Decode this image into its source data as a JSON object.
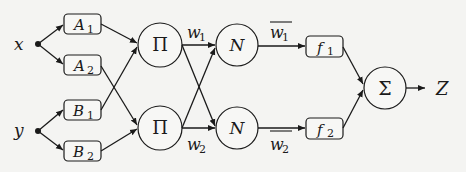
{
  "diagram": {
    "type": "ANFIS architecture",
    "inputs": [
      {
        "id": "x",
        "label": "x"
      },
      {
        "id": "y",
        "label": "y"
      }
    ],
    "layer1": [
      {
        "id": "A1",
        "label": "A",
        "sub": "1"
      },
      {
        "id": "A2",
        "label": "A",
        "sub": "2"
      },
      {
        "id": "B1",
        "label": "B",
        "sub": "1"
      },
      {
        "id": "B2",
        "label": "B",
        "sub": "2"
      }
    ],
    "layer2": [
      {
        "id": "P1",
        "symbol": "Π"
      },
      {
        "id": "P2",
        "symbol": "Π"
      }
    ],
    "weights": [
      {
        "label": "w",
        "sub": "1"
      },
      {
        "label": "w",
        "sub": "2"
      }
    ],
    "layer3": [
      {
        "id": "N1",
        "symbol": "N"
      },
      {
        "id": "N2",
        "symbol": "N"
      }
    ],
    "normalized_weights": [
      {
        "label": "w",
        "sub": "1",
        "overline": true
      },
      {
        "label": "w",
        "sub": "2",
        "overline": true
      }
    ],
    "layer4": [
      {
        "id": "f1",
        "label": "f",
        "sub": "1"
      },
      {
        "id": "f2",
        "label": "f",
        "sub": "2"
      }
    ],
    "layer5": {
      "id": "S",
      "symbol": "Σ"
    },
    "output": {
      "label": "Z"
    }
  }
}
